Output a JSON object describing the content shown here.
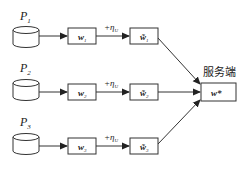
{
  "diagram": {
    "server": {
      "label": "服务端",
      "model": "w*"
    },
    "noise_label": "+η",
    "noise_sub": "U",
    "participants": [
      {
        "name": "P",
        "sub": "1",
        "local_model": "w",
        "local_sub": "1",
        "noisy_model": "w̃",
        "noisy_sub": "1"
      },
      {
        "name": "P",
        "sub": "2",
        "local_model": "w",
        "local_sub": "2",
        "noisy_model": "w̃",
        "noisy_sub": "2"
      },
      {
        "name": "P",
        "sub": "3",
        "local_model": "w",
        "local_sub": "3",
        "noisy_model": "w̃",
        "noisy_sub": "3"
      }
    ],
    "colors": {
      "stroke": "#333333",
      "background": "#ffffff"
    }
  }
}
